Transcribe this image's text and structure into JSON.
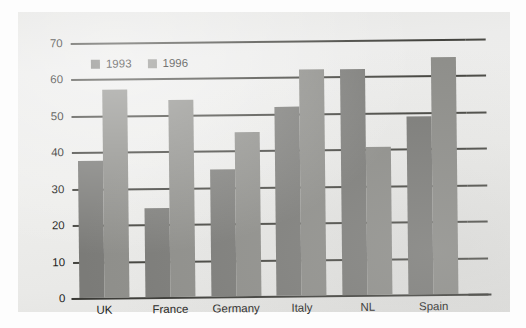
{
  "chart_data": {
    "type": "bar",
    "title": "",
    "xlabel": "",
    "ylabel": "",
    "categories": [
      "UK",
      "France",
      "Germany",
      "Italy",
      "NL",
      "Spain"
    ],
    "series": [
      {
        "name": "1993",
        "color": "#7b7b78",
        "values": [
          37.5,
          24.5,
          35,
          52,
          62,
          49
        ]
      },
      {
        "name": "1996",
        "color": "#8e8e8a",
        "values": [
          57,
          54,
          45,
          62,
          40.5,
          65
        ]
      }
    ],
    "ylim": [
      0,
      70
    ],
    "yticks": [
      0,
      10,
      20,
      30,
      40,
      50,
      60,
      70
    ],
    "ytick_labels": [
      "0",
      "10",
      "20",
      "30",
      "40",
      "50",
      "60",
      "70"
    ],
    "grid": true,
    "grid_axis": "y",
    "legend_position": "top-left-inside",
    "annotations": []
  },
  "legend": {
    "items": [
      {
        "label": "1993",
        "swatch": "legend-swatch-1993"
      },
      {
        "label": "1996",
        "swatch": "legend-swatch-1996"
      }
    ]
  }
}
